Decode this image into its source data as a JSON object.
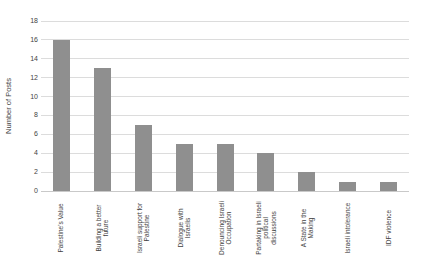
{
  "chart_data": {
    "type": "bar",
    "title": "",
    "ylabel": "Number of Posts",
    "xlabel": "",
    "categories": [
      "Palestine's Value",
      "Building a better future",
      "Israeli support for Palestine",
      "Dialogue with Israelis",
      "Denouncing Israeli Occupation",
      "Partaking in Israeli political discussions",
      "A State in the Making",
      "Israeli intolerance",
      "IDF violence"
    ],
    "category_label_lines": [
      [
        "Palestine's Value"
      ],
      [
        "Building a better",
        "future"
      ],
      [
        "Israeli support for",
        "Palestine"
      ],
      [
        "Dialogue with",
        "Israelis"
      ],
      [
        "Denouncing Israeli",
        "Occupation"
      ],
      [
        "Partaking in Israeli",
        "political",
        "discussions"
      ],
      [
        "A State in the",
        "Making"
      ],
      [
        "Israeli intolerance"
      ],
      [
        "IDF violence"
      ]
    ],
    "values": [
      16,
      13,
      7,
      5,
      5,
      4,
      2,
      1,
      1
    ],
    "ylim": [
      0,
      18
    ],
    "yticks": [
      0,
      2,
      4,
      6,
      8,
      10,
      12,
      14,
      16,
      18
    ],
    "grid": "horizontal",
    "legend": "none",
    "bar_color": "#8F8F8F",
    "gridline_color": "#DCDCDC",
    "axis_line_color": "#C9C9C9",
    "text_color": "#3f3f3f"
  }
}
